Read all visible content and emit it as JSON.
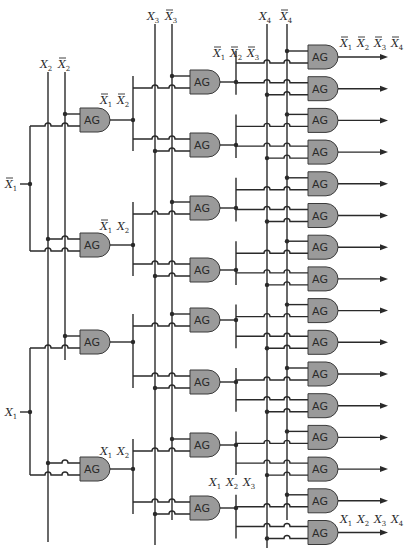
{
  "gate_label": "AG",
  "inputs": [
    {
      "id": "x1bar",
      "label": "X",
      "sub": "1",
      "bar": true
    },
    {
      "id": "x1",
      "label": "X",
      "sub": "1",
      "bar": false
    },
    {
      "id": "x2",
      "label": "X",
      "sub": "2",
      "bar": false
    },
    {
      "id": "x2bar",
      "label": "X",
      "sub": "2",
      "bar": true
    },
    {
      "id": "x3",
      "label": "X",
      "sub": "3",
      "bar": false
    },
    {
      "id": "x3bar",
      "label": "X",
      "sub": "3",
      "bar": true
    },
    {
      "id": "x4",
      "label": "X",
      "sub": "4",
      "bar": false
    },
    {
      "id": "x4bar",
      "label": "X",
      "sub": "4",
      "bar": true
    }
  ],
  "stage1_annotations": [
    {
      "terms": [
        {
          "sub": "1",
          "bar": true
        },
        {
          "sub": "2",
          "bar": true
        }
      ]
    },
    {
      "terms": [
        {
          "sub": "1",
          "bar": true
        },
        {
          "sub": "2",
          "bar": false
        }
      ]
    },
    {
      "terms": [
        {
          "sub": "1",
          "bar": false
        },
        {
          "sub": "2",
          "bar": false
        }
      ]
    }
  ],
  "stage2_annotations": [
    {
      "terms": [
        {
          "sub": "1",
          "bar": true
        },
        {
          "sub": "2",
          "bar": true
        },
        {
          "sub": "3",
          "bar": true
        }
      ]
    },
    {
      "terms": [
        {
          "sub": "1",
          "bar": false
        },
        {
          "sub": "2",
          "bar": false
        },
        {
          "sub": "3",
          "bar": false
        }
      ]
    }
  ],
  "output_annotations": [
    {
      "terms": [
        {
          "sub": "1",
          "bar": true
        },
        {
          "sub": "2",
          "bar": true
        },
        {
          "sub": "3",
          "bar": true
        },
        {
          "sub": "4",
          "bar": true
        }
      ]
    },
    {
      "terms": [
        {
          "sub": "1",
          "bar": false
        },
        {
          "sub": "2",
          "bar": false
        },
        {
          "sub": "3",
          "bar": false
        },
        {
          "sub": "4",
          "bar": false
        }
      ]
    }
  ],
  "stage_gate_counts": [
    4,
    8,
    16
  ]
}
